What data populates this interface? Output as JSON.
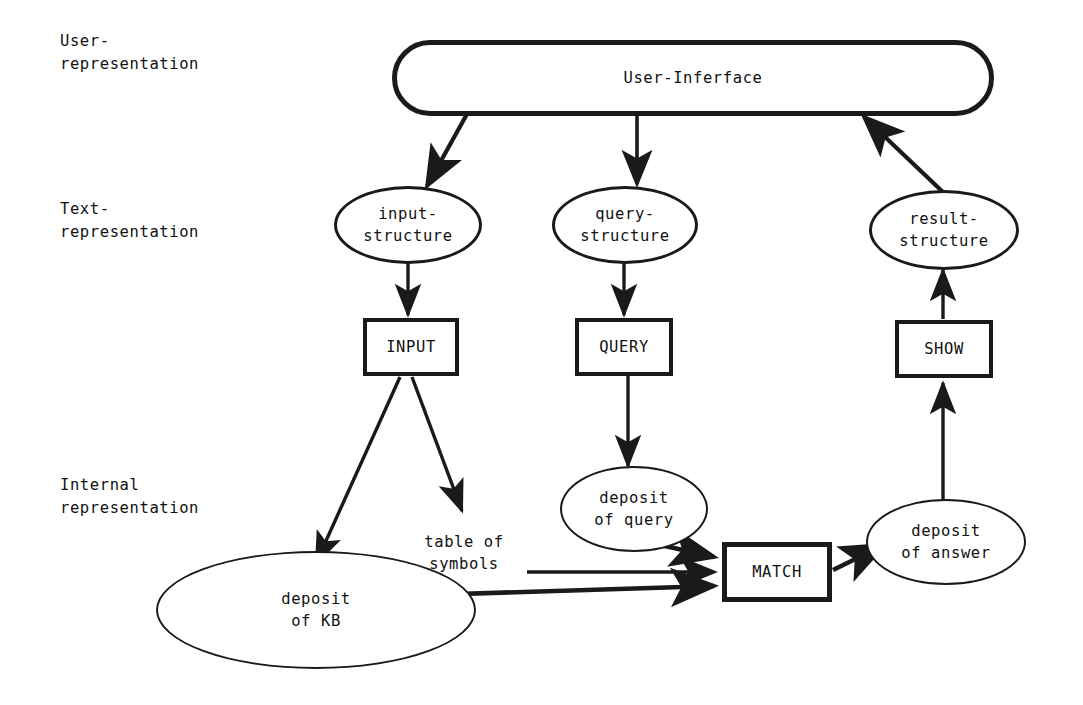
{
  "diagram": {
    "ink_color": "#1a1a1a",
    "background": "#ffffff",
    "row_labels": [
      {
        "id": "row-user",
        "line1": "User-",
        "line2": "representation"
      },
      {
        "id": "row-text",
        "line1": "Text-",
        "line2": "representation"
      },
      {
        "id": "row-internal",
        "line1": "Internal",
        "line2": "representation"
      }
    ],
    "nodes": [
      {
        "id": "user-interface",
        "label": "User-Inferface",
        "shape": "stadium"
      },
      {
        "id": "input-structure",
        "label": "input-\nstructure",
        "shape": "ellipse"
      },
      {
        "id": "query-structure",
        "label": "query-\nstructure",
        "shape": "ellipse"
      },
      {
        "id": "result-structure",
        "label": "result-\nstructure",
        "shape": "ellipse"
      },
      {
        "id": "input-box",
        "label": "INPUT",
        "shape": "rect"
      },
      {
        "id": "query-box",
        "label": "QUERY",
        "shape": "rect"
      },
      {
        "id": "show-box",
        "label": "SHOW",
        "shape": "rect"
      },
      {
        "id": "match-box",
        "label": "MATCH",
        "shape": "rect"
      },
      {
        "id": "table-of-symbols",
        "label": "table of\nsymbols",
        "shape": "plain"
      },
      {
        "id": "deposit-of-query",
        "label": "deposit\nof query",
        "shape": "ellipse"
      },
      {
        "id": "deposit-of-answer",
        "label": "deposit\nof answer",
        "shape": "ellipse"
      },
      {
        "id": "deposit-of-kb",
        "label": "deposit\nof KB",
        "shape": "ellipse"
      }
    ],
    "edges": [
      {
        "id": "ui-to-input-structure",
        "from": "user-interface",
        "to": "input-structure",
        "arrow": "to"
      },
      {
        "id": "ui-to-query-structure",
        "from": "user-interface",
        "to": "query-structure",
        "arrow": "to"
      },
      {
        "id": "result-structure-to-ui",
        "from": "result-structure",
        "to": "user-interface",
        "arrow": "to"
      },
      {
        "id": "input-structure-to-input-box",
        "from": "input-structure",
        "to": "input-box",
        "arrow": "to"
      },
      {
        "id": "query-structure-to-query-box",
        "from": "query-structure",
        "to": "query-box",
        "arrow": "to"
      },
      {
        "id": "show-box-to-result-structure",
        "from": "show-box",
        "to": "result-structure",
        "arrow": "to"
      },
      {
        "id": "input-box-to-deposit-of-kb",
        "from": "input-box",
        "to": "deposit-of-kb",
        "arrow": "to"
      },
      {
        "id": "input-box-to-table-of-symbols",
        "from": "input-box",
        "to": "table-of-symbols",
        "arrow": "to"
      },
      {
        "id": "query-box-to-deposit-of-query",
        "from": "query-box",
        "to": "deposit-of-query",
        "arrow": "to"
      },
      {
        "id": "deposit-of-query-to-match",
        "from": "deposit-of-query",
        "to": "match-box",
        "arrow": "to"
      },
      {
        "id": "table-of-symbols-to-match",
        "from": "table-of-symbols",
        "to": "match-box",
        "arrow": "to"
      },
      {
        "id": "deposit-of-kb-to-match",
        "from": "deposit-of-kb",
        "to": "match-box",
        "arrow": "to"
      },
      {
        "id": "match-to-deposit-of-answer",
        "from": "match-box",
        "to": "deposit-of-answer",
        "arrow": "to"
      },
      {
        "id": "deposit-of-answer-to-show",
        "from": "deposit-of-answer",
        "to": "show-box",
        "arrow": "to"
      }
    ]
  }
}
